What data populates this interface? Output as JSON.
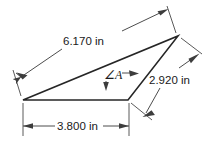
{
  "figure": {
    "colors": {
      "shape_stroke": "#262626",
      "dimension_line": "#4d4d4d",
      "text": "#1a1a1a",
      "background": "#ffffff"
    },
    "dimensions": [
      {
        "id": "hypotenuse",
        "label": "6.170 in",
        "value": 6.17,
        "unit": "in",
        "position": "upper-left-slanted"
      },
      {
        "id": "right-side",
        "label": "2.920 in",
        "value": 2.92,
        "unit": "in",
        "position": "right-slanted"
      },
      {
        "id": "base",
        "label": "3.800 in",
        "value": 3.8,
        "unit": "in",
        "position": "bottom-horizontal"
      }
    ],
    "angle": {
      "id": "angle-a",
      "symbol": "∠",
      "name": "A",
      "label": "∠A",
      "position": "interior-lower-right-vertex"
    }
  }
}
